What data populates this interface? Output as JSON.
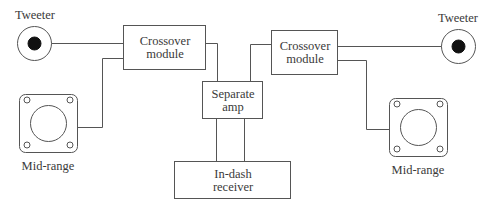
{
  "diagram": {
    "type": "car audio wiring block diagram",
    "colors": {
      "line": "#555555",
      "dot": "#111111",
      "background": "#ffffff"
    },
    "components": {
      "tweeter_left": {
        "label": "Tweeter",
        "icon": "tweeter-speaker-icon"
      },
      "tweeter_right": {
        "label": "Tweeter",
        "icon": "tweeter-speaker-icon"
      },
      "midrange_left": {
        "label": "Mid-range",
        "icon": "midrange-speaker-icon"
      },
      "midrange_right": {
        "label": "Mid-range",
        "icon": "midrange-speaker-icon"
      },
      "crossover_left": {
        "line1": "Crossover",
        "line2": "module"
      },
      "crossover_right": {
        "line1": "Crossover",
        "line2": "module"
      },
      "amp": {
        "line1": "Separate",
        "line2": "amp"
      },
      "receiver": {
        "line1": "In-dash",
        "line2": "receiver"
      }
    },
    "connections": [
      [
        "tweeter_left",
        "crossover_left"
      ],
      [
        "midrange_left",
        "crossover_left"
      ],
      [
        "crossover_left",
        "amp"
      ],
      [
        "tweeter_right",
        "crossover_right"
      ],
      [
        "midrange_right",
        "crossover_right"
      ],
      [
        "crossover_right",
        "amp"
      ],
      [
        "amp",
        "receiver"
      ],
      [
        "amp",
        "receiver"
      ]
    ]
  }
}
